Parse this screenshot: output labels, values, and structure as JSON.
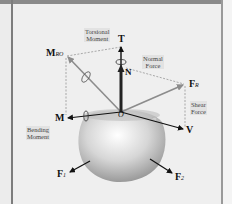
{
  "figure": {
    "labels": {
      "torsional_moment": [
        "Torsional",
        "Moment"
      ],
      "normal_force": [
        "Normal",
        "Force"
      ],
      "shear_force": [
        "Shear",
        "Force"
      ],
      "bending_moment": [
        "Bending",
        "Moment"
      ]
    },
    "symbols": {
      "T": "T",
      "N": "N",
      "M_Ro_main": "M",
      "M_Ro_sub": "RO",
      "F_R_main": "F",
      "F_R_sub": "R",
      "M": "M",
      "O": "O",
      "V": "V",
      "F1_main": "F",
      "F1_sub": "1",
      "F2_main": "F",
      "F2_sub": "2"
    },
    "colors": {
      "background": "#efefef",
      "frame": "#7d7d7d",
      "resultant_arrow": "#8c8c8c",
      "component_arrow": "#111111",
      "body": "#c8c8c8",
      "dashed": "#8a8a8a"
    }
  }
}
